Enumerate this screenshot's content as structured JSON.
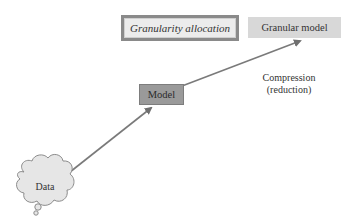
{
  "diagram": {
    "nodes": {
      "granularity_allocation": "Granularity allocation",
      "granular_model": "Granular model",
      "model": "Model",
      "data": "Data"
    },
    "annotations": {
      "compression_line1": "Compression",
      "compression_line2": "(reduction)"
    },
    "edges": [
      {
        "from": "Data",
        "to": "Model"
      },
      {
        "from": "Model",
        "to": "Granular model"
      }
    ],
    "colors": {
      "arrow": "#7a7a7a",
      "model_fill": "#9a9a9a",
      "granular_fill": "#d8d8d8",
      "allocation_fill": "#ececec",
      "allocation_border": "#8a8a8a",
      "cloud_fill": "#e6e6e6"
    }
  }
}
